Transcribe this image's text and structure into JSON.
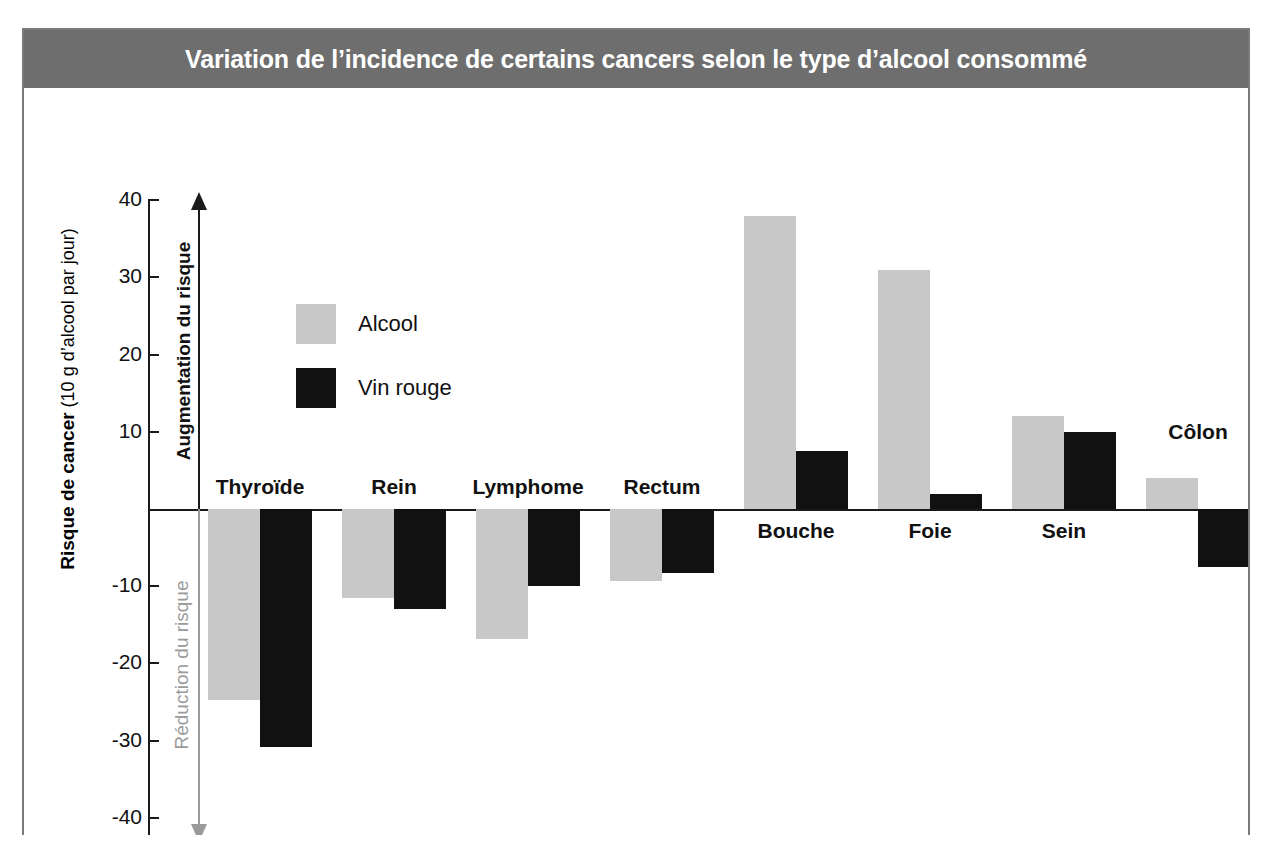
{
  "title": "Variation de l’incidence de certains cancers selon le type d’alcool consommé",
  "colors": {
    "title_band": "#6e6e6e",
    "title_text": "#ffffff",
    "alcool": "#c8c8c8",
    "vin_rouge": "#111111",
    "axis": "#1a1a1a",
    "reduction_arrow": "#9a9a9a",
    "frame": "#7a7a7a"
  },
  "axis": {
    "y_label_strong": "Risque de cancer",
    "y_label_light": " (10 g d’alcool par jour)",
    "ticks": [
      "40",
      "30",
      "20",
      "10",
      "-10",
      "-20",
      "-30",
      "-40"
    ]
  },
  "annotations": {
    "increase": "Augmentation du risque",
    "decrease": "Réduction du risque"
  },
  "legend": {
    "items": [
      {
        "label": "Alcool",
        "color": "#c8c8c8",
        "swatch_name": "legend-swatch-alcool"
      },
      {
        "label": "Vin rouge",
        "color": "#111111",
        "swatch_name": "legend-swatch-vin-rouge"
      }
    ]
  },
  "chart_data": {
    "type": "bar",
    "title": "Variation de l’incidence de certains cancers selon le type d’alcool consommé",
    "xlabel": "",
    "ylabel": "Risque de cancer (10 g d’alcool par jour)",
    "ylim": [
      -40,
      40
    ],
    "yticks": [
      40,
      30,
      20,
      10,
      0,
      -10,
      -20,
      -30,
      -40
    ],
    "grid": false,
    "legend_position": "upper-left-inside",
    "categories": [
      "Thyroïde",
      "Rein",
      "Lymphome",
      "Rectum",
      "Bouche",
      "Foie",
      "Sein",
      "Côlon"
    ],
    "series": [
      {
        "name": "Alcool",
        "color": "#c8c8c8",
        "values": [
          -24.7,
          -11.5,
          -16.8,
          -9.3,
          38,
          31,
          12,
          4
        ]
      },
      {
        "name": "Vin rouge",
        "color": "#111111",
        "values": [
          -30.8,
          -13.0,
          -10.0,
          -8.3,
          7.5,
          2,
          10,
          -7.5
        ]
      }
    ],
    "annotations": [
      {
        "text": "Augmentation du risque",
        "direction": "up",
        "color": "#1a1a1a"
      },
      {
        "text": "Réduction du risque",
        "direction": "down",
        "color": "#9a9a9a"
      }
    ]
  }
}
